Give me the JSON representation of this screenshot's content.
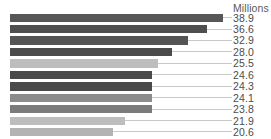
{
  "chart_data": {
    "type": "bar",
    "orientation": "horizontal",
    "title": "",
    "subtitle": "",
    "xlabel": "",
    "ylabel": "",
    "unit_label": "Millions",
    "categories": [
      "",
      "",
      "",
      "",
      "",
      "",
      "",
      "",
      "",
      "",
      ""
    ],
    "values": [
      38.9,
      36.6,
      32.9,
      28.0,
      25.5,
      24.6,
      24.3,
      24.1,
      23.8,
      21.9,
      20.6
    ],
    "value_labels": [
      "38.9",
      "36.6",
      "32.9",
      "28.0",
      "25.5",
      "24.6",
      "24.3",
      "24.1",
      "23.8",
      "21.9",
      "20.6"
    ],
    "bar_colors": [
      "#575757",
      "#4f4f4f",
      "#545454",
      "#4b4b4b",
      "#bdbdbd",
      "#4a4a4a",
      "#4a4a4a",
      "#8c8c8c",
      "#7b7b7b",
      "#bdbdbd",
      "#b3b3b3"
    ],
    "bar_pixel_widths": [
      213,
      197,
      178,
      162,
      148,
      142,
      142,
      142,
      142,
      115,
      103
    ],
    "leader_pixel_width": 222,
    "leader_color": "#c9c9c9",
    "grid": false,
    "legend": "none",
    "xlim": [
      0,
      38.9
    ],
    "background": "#ffffff",
    "label_color": "#4d4d4d",
    "axis_title_color": "#5a5a5a"
  }
}
